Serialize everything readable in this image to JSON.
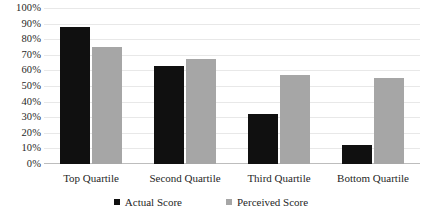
{
  "chart_data": {
    "type": "bar",
    "title": "",
    "subtitle": "",
    "xlabel": "",
    "ylabel": "",
    "ylim": [
      0,
      100
    ],
    "grid": true,
    "legend_position": "bottom",
    "categories": [
      "Top Quartile",
      "Second Quartile",
      "Third Quartile",
      "Bottom Quartile"
    ],
    "ytick_labels": [
      "100%",
      "90%",
      "80%",
      "70%",
      "60%",
      "50%",
      "40%",
      "30%",
      "20%",
      "10%",
      "0%"
    ],
    "ytick_values": [
      100,
      90,
      80,
      70,
      60,
      50,
      40,
      30,
      20,
      10,
      0
    ],
    "series": [
      {
        "name": "Actual Score",
        "color": "#101010",
        "values": [
          88,
          63,
          32,
          12
        ]
      },
      {
        "name": "Perceived Score",
        "color": "#a6a6a6",
        "values": [
          75,
          67,
          57,
          55
        ]
      }
    ]
  },
  "legend": {
    "items": [
      {
        "label": "Actual Score",
        "swatch": "legend-swatch-black"
      },
      {
        "label": "Perceived Score",
        "swatch": "legend-swatch-gray"
      }
    ]
  }
}
